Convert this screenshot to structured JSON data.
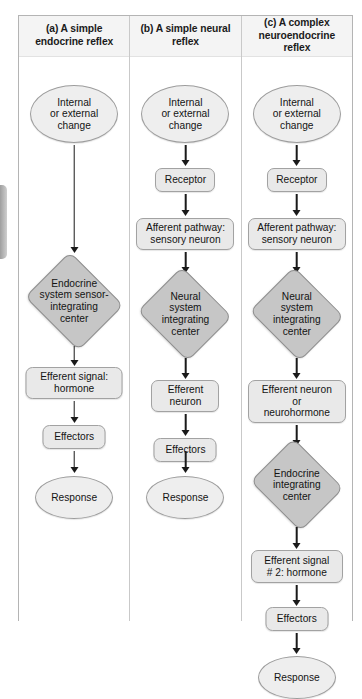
{
  "figure": {
    "type": "flowchart",
    "columns": [
      {
        "id": "a",
        "header": "(a) A simple endocrine reflex",
        "header_lines": [
          "(a) A simple",
          "endocrine reflex"
        ],
        "nodes": [
          {
            "id": "a-stimulus",
            "shape": "oval",
            "label": "Internal or external change",
            "lines": [
              "Internal",
              "or external",
              "change"
            ]
          },
          {
            "id": "a-integrating-center",
            "shape": "diamond",
            "label": "Endocrine system sensor-integrating center",
            "lines": [
              "Endocrine",
              "system sensor-",
              "integrating",
              "center"
            ]
          },
          {
            "id": "a-efferent-signal",
            "shape": "rrect",
            "label": "Efferent signal: hormone",
            "lines": [
              "Efferent signal:",
              "hormone"
            ]
          },
          {
            "id": "a-effectors",
            "shape": "rrect",
            "label": "Effectors",
            "lines": [
              "Effectors"
            ]
          },
          {
            "id": "a-response",
            "shape": "oval",
            "label": "Response",
            "lines": [
              "Response"
            ]
          }
        ]
      },
      {
        "id": "b",
        "header": "(b) A simple neural reflex",
        "header_lines": [
          "(b) A simple neural",
          "reflex"
        ],
        "nodes": [
          {
            "id": "b-stimulus",
            "shape": "oval",
            "label": "Internal or external change",
            "lines": [
              "Internal",
              "or external",
              "change"
            ]
          },
          {
            "id": "b-receptor",
            "shape": "rrect",
            "label": "Receptor",
            "lines": [
              "Receptor"
            ]
          },
          {
            "id": "b-afferent-pathway",
            "shape": "rrect",
            "label": "Afferent pathway: sensory neuron",
            "lines": [
              "Afferent pathway:",
              "sensory neuron"
            ]
          },
          {
            "id": "b-integrating-center",
            "shape": "diamond",
            "label": "Neural system integrating center",
            "lines": [
              "Neural",
              "system",
              "integrating",
              "center"
            ]
          },
          {
            "id": "b-efferent-neuron",
            "shape": "rrect",
            "label": "Efferent neuron",
            "lines": [
              "Efferent",
              "neuron"
            ]
          },
          {
            "id": "b-effectors",
            "shape": "rrect",
            "label": "Effectors",
            "lines": [
              "Effectors"
            ]
          },
          {
            "id": "b-response",
            "shape": "oval",
            "label": "Response",
            "lines": [
              "Response"
            ]
          }
        ]
      },
      {
        "id": "c",
        "header": "(c) A complex neuroendocrine reflex",
        "header_lines": [
          "(c) A complex",
          "neuroendocrine reflex"
        ],
        "nodes": [
          {
            "id": "c-stimulus",
            "shape": "oval",
            "label": "Internal or external change",
            "lines": [
              "Internal",
              "or external",
              "change"
            ]
          },
          {
            "id": "c-receptor",
            "shape": "rrect",
            "label": "Receptor",
            "lines": [
              "Receptor"
            ]
          },
          {
            "id": "c-afferent-pathway",
            "shape": "rrect",
            "label": "Afferent pathway: sensory neuron",
            "lines": [
              "Afferent pathway:",
              "sensory neuron"
            ]
          },
          {
            "id": "c-neural-integrating-center",
            "shape": "diamond",
            "label": "Neural system integrating center",
            "lines": [
              "Neural",
              "system",
              "integrating",
              "center"
            ]
          },
          {
            "id": "c-efferent-neuron",
            "shape": "rrect",
            "label": "Efferent neuron or neurohormone",
            "lines": [
              "Efferent neuron",
              "or",
              "neurohormone"
            ]
          },
          {
            "id": "c-endocrine-integrating-center",
            "shape": "diamond",
            "label": "Endocrine integrating center",
            "lines": [
              "Endocrine",
              "integrating",
              "center"
            ]
          },
          {
            "id": "c-efferent-signal-2",
            "shape": "rrect",
            "label": "Efferent signal # 2: hormone",
            "lines": [
              "Efferent signal",
              "# 2: hormone"
            ]
          },
          {
            "id": "c-effectors",
            "shape": "rrect",
            "label": "Effectors",
            "lines": [
              "Effectors"
            ]
          },
          {
            "id": "c-response",
            "shape": "oval",
            "label": "Response",
            "lines": [
              "Response"
            ]
          }
        ]
      }
    ],
    "colors": {
      "page_background": "#ffffff",
      "frame_border": "#b4b4b4",
      "column_divider": "#c9c9c9",
      "header_background": "#f4f4f4",
      "node_fill_light": "#e9e9e9",
      "node_fill_oval": "#eeeeee",
      "node_fill_diamond": "#c6c6c6",
      "node_border": "#9d9d9d",
      "arrow": "#1a1a1a",
      "text": "#141414"
    }
  }
}
